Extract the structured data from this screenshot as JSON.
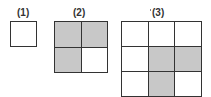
{
  "figures": [
    {
      "label": "(1)",
      "size": 1,
      "shaded": [
        [
          0
        ]
      ]
    },
    {
      "label": "(2)",
      "size": 2,
      "shaded": [
        [
          1,
          1
        ],
        [
          1,
          0
        ]
      ]
    },
    {
      "label": "(3)",
      "size": 3,
      "shaded": [
        [
          0,
          0,
          0
        ],
        [
          0,
          1,
          1
        ],
        [
          0,
          1,
          0
        ]
      ]
    }
  ],
  "colors": {
    "shaded": "#c8c8c8",
    "line": "#333333",
    "background": "#ffffff"
  }
}
